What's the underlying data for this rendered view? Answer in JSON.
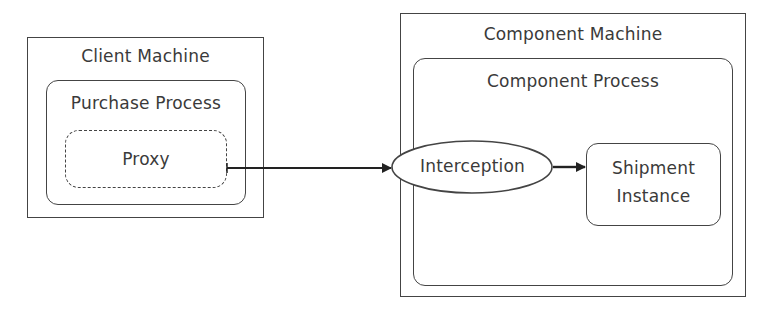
{
  "diagram": {
    "client_machine": {
      "label": "Client Machine",
      "purchase_process": {
        "label": "Purchase Process",
        "proxy": {
          "label": "Proxy"
        }
      }
    },
    "component_machine": {
      "label": "Component Machine",
      "component_process": {
        "label": "Component Process",
        "interception": {
          "label": "Interception"
        },
        "shipment_instance": {
          "label_line1": "Shipment",
          "label_line2": "Instance"
        }
      }
    },
    "edges": [
      {
        "from": "Proxy",
        "to": "Interception"
      },
      {
        "from": "Interception",
        "to": "Shipment Instance"
      }
    ],
    "colors": {
      "stroke": "#444444",
      "text": "#3a3a3a",
      "background": "#ffffff"
    }
  }
}
